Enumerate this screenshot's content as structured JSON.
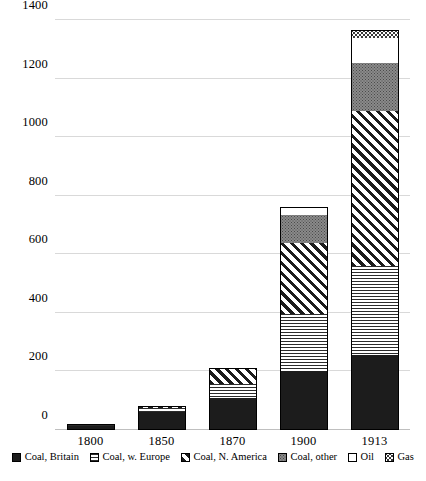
{
  "chart_data": {
    "type": "bar",
    "stacked": true,
    "title": "",
    "subtitle": "",
    "xlabel": "",
    "ylabel": "",
    "categories": [
      "1800",
      "1850",
      "1870",
      "1900",
      "1913"
    ],
    "ylim": [
      0,
      1400
    ],
    "yticks": [
      0,
      200,
      400,
      600,
      800,
      1000,
      1200,
      1400
    ],
    "ytick_labels": [
      "0",
      "200",
      "400",
      "600",
      "800",
      "1000",
      "1200",
      "1400"
    ],
    "grid": true,
    "legend_position": "bottom",
    "series": [
      {
        "name": "Coal, Britain",
        "pattern": "solid-black",
        "values": [
          15,
          62,
          110,
          200,
          255
        ]
      },
      {
        "name": "Coal, w. Europe",
        "pattern": "horizontal-lines",
        "values": [
          2,
          12,
          48,
          195,
          305
        ]
      },
      {
        "name": "Coal, N. America",
        "pattern": "diagonal-hatch",
        "values": [
          1,
          8,
          55,
          245,
          530
        ]
      },
      {
        "name": "Coal, other",
        "pattern": "dotted-gray",
        "values": [
          0,
          0,
          0,
          95,
          165
        ]
      },
      {
        "name": "Oil",
        "pattern": "white",
        "values": [
          0,
          0,
          0,
          25,
          85
        ]
      },
      {
        "name": "Gas",
        "pattern": "white-dotted",
        "values": [
          0,
          0,
          0,
          0,
          25
        ]
      }
    ],
    "totals": [
      18,
      82,
      213,
      760,
      1365
    ]
  },
  "legend": {
    "items": [
      {
        "label": "Coal, Britain"
      },
      {
        "label": "Coal, w. Europe"
      },
      {
        "label": "Coal, N. America"
      },
      {
        "label": "Coal, other"
      },
      {
        "label": "Oil"
      },
      {
        "label": "Gas"
      }
    ]
  },
  "colors": {
    "black": "#1c1c1c",
    "gray": "#8a8a8a",
    "white": "#ffffff",
    "gridline": "#d9d9d9"
  }
}
